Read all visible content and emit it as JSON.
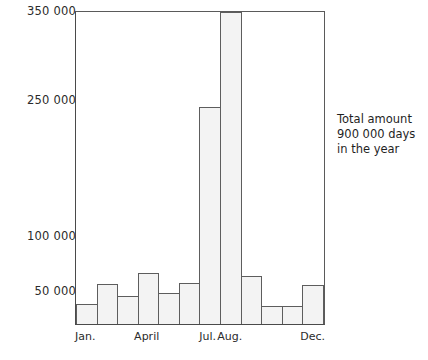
{
  "chart_data": {
    "type": "bar",
    "title": "",
    "xlabel": "",
    "ylabel": "",
    "categories": [
      "Jan.",
      "Feb.",
      "Mar.",
      "April",
      "May",
      "Jun.",
      "Jul.",
      "Aug.",
      "Sep.",
      "Oct.",
      "Nov.",
      "Dec."
    ],
    "values": [
      22000,
      45000,
      32000,
      57000,
      35000,
      46000,
      243000,
      350000,
      54000,
      20000,
      20000,
      44000
    ],
    "ylim": [
      0,
      350000
    ],
    "yticks": [
      350000,
      250000,
      100000,
      50000
    ],
    "ytick_labels": [
      "350 000",
      "250 000",
      "100 000",
      "50 000"
    ],
    "visible_xtick_labels": [
      "Jan.",
      "April",
      "Jul.",
      "Aug.",
      "Dec."
    ],
    "grid": false,
    "legend": null,
    "bar_fill_color": "#f3f3f3",
    "bar_border_color": "#5d5d5d",
    "axis_color": "#4a4a4a",
    "annotation": [
      "Total amount",
      "900 000 days",
      "in the year"
    ]
  },
  "axis": {
    "y_ticks": [
      {
        "label": "350 000",
        "value": 350000,
        "top_px": 5
      },
      {
        "label": "250 000",
        "value": 250000,
        "top_px": 94
      },
      {
        "label": "100 000",
        "value": 100000,
        "top_px": 230
      },
      {
        "label": "50 000",
        "value": 50000,
        "top_px": 285
      }
    ],
    "x_slots": [
      {
        "label": "Jan."
      },
      {
        "label": ""
      },
      {
        "label": ""
      },
      {
        "label": "April"
      },
      {
        "label": ""
      },
      {
        "label": ""
      },
      {
        "label": "Jul."
      },
      {
        "label": "Aug."
      },
      {
        "label": ""
      },
      {
        "label": ""
      },
      {
        "label": ""
      },
      {
        "label": "Dec."
      }
    ]
  },
  "bars": [
    {
      "month": "Jan.",
      "value": 22000,
      "height_pct": 6.3
    },
    {
      "month": "Feb.",
      "value": 45000,
      "height_pct": 12.9
    },
    {
      "month": "Mar.",
      "value": 32000,
      "height_pct": 9.1
    },
    {
      "month": "April",
      "value": 57000,
      "height_pct": 16.3
    },
    {
      "month": "May",
      "value": 35000,
      "height_pct": 10.0
    },
    {
      "month": "Jun.",
      "value": 46000,
      "height_pct": 13.1
    },
    {
      "month": "Jul.",
      "value": 243000,
      "height_pct": 69.4
    },
    {
      "month": "Aug.",
      "value": 350000,
      "height_pct": 100
    },
    {
      "month": "Sep.",
      "value": 54000,
      "height_pct": 15.4
    },
    {
      "month": "Oct.",
      "value": 20000,
      "height_pct": 5.7
    },
    {
      "month": "Nov.",
      "value": 20000,
      "height_pct": 5.7
    },
    {
      "month": "Dec.",
      "value": 44000,
      "height_pct": 12.6
    }
  ],
  "annotation": {
    "line1": "Total amount",
    "line2": "900 000 days",
    "line3": "in the year"
  }
}
